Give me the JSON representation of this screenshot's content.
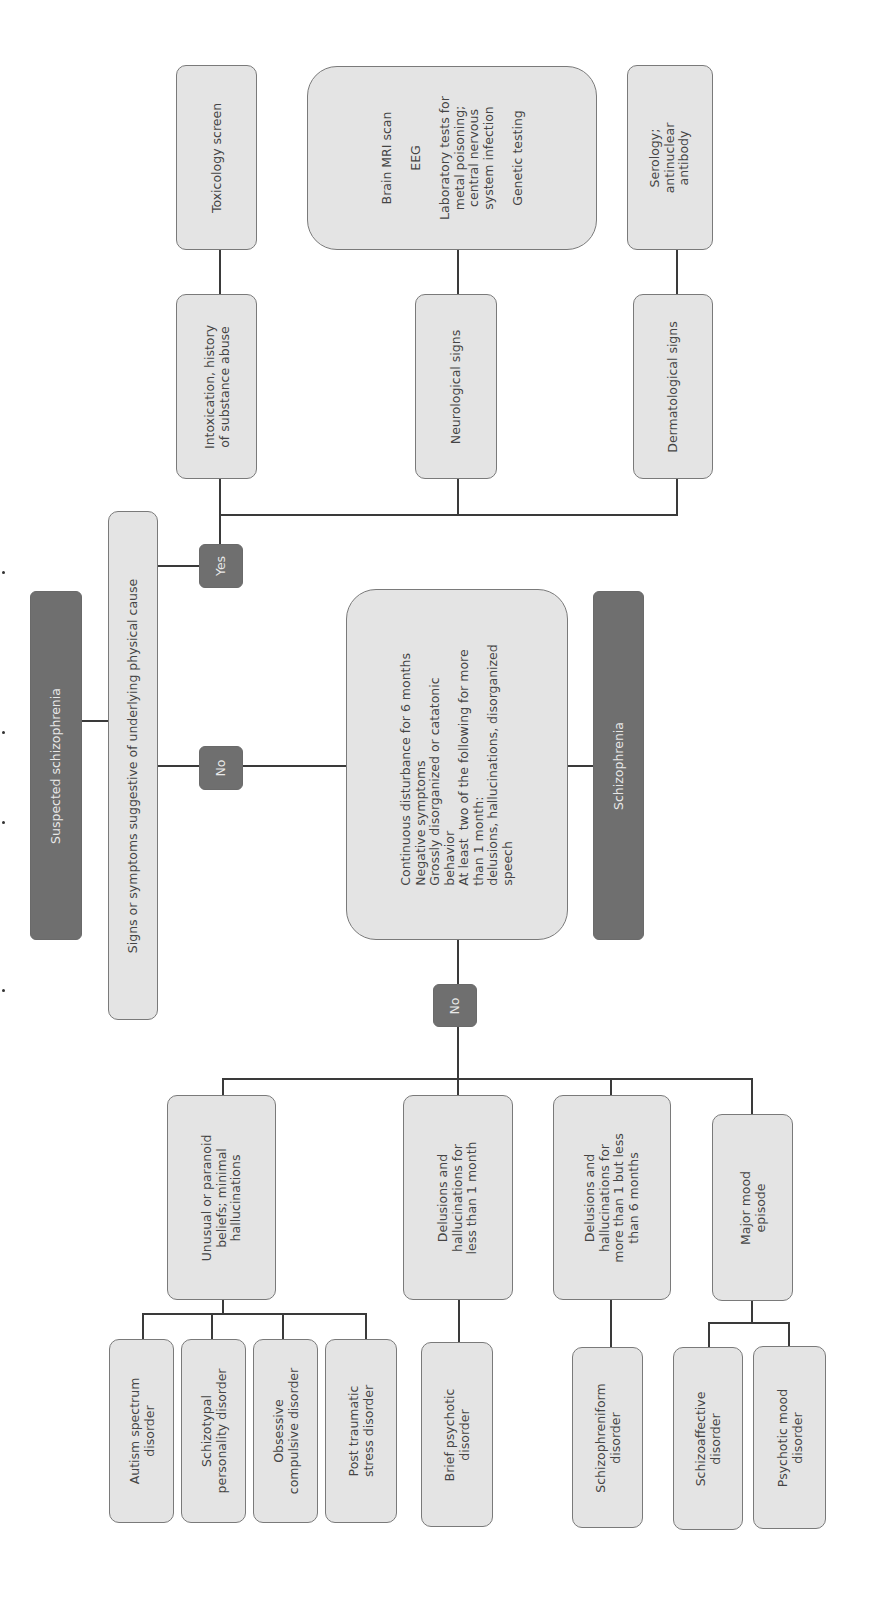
{
  "diagram": {
    "title": "Suspected schizophrenia",
    "root_question": "Signs or symptoms suggestive of underlying physical cause",
    "yes_label": "Yes",
    "no_label": "No",
    "no2_label": "No",
    "physical_causes": {
      "intoxication": "Intoxication, history\nof substance abuse",
      "toxicology": "Toxicology screen",
      "neurological": "Neurological signs",
      "neuro_tests": "Brain MRI scan\n\nEEG\n\nLaboratory tests for\nmetal poisoning;\ncentral nervous\nsystem infection\n\nGenetic testing",
      "dermatological": "Dermatological signs",
      "serology": "Serology;\nantinuclear\nantibody"
    },
    "criteria": "Continuous disturbance for 6 months\nNegative symptoms\nGrossly disorganized or catatonic\nbehavior\nAt least  two of the following for more\nthan 1 month:\ndelusions, hallucinations, disorganized\nspeech",
    "diagnosis": "Schizophrenia",
    "branches": [
      {
        "label": "Unusual or paranoid\nbeliefs; minimal\nhallucinations",
        "outcomes": [
          "Autism spectrum\ndisorder",
          "Schizotypal\npersonality disorder",
          "Obsessive\ncompulsive disorder",
          "Post traumatic\nstress disorder"
        ]
      },
      {
        "label": "Delusions and\nhallucinations for\nless than 1 month",
        "outcomes": [
          "Brief psychotic\ndisorder"
        ]
      },
      {
        "label": "Delusions and\nhallucinations for\nmore than 1 but less\nthan 6 months",
        "outcomes": [
          "Schizophreniform\ndisorder"
        ]
      },
      {
        "label": "Major mood\nepisode",
        "outcomes": [
          "Schizoaffective\ndisorder",
          "Psychotic mood\ndisorder"
        ]
      }
    ]
  },
  "colors": {
    "light_box": "#e4e4e4",
    "dark_box": "#6f6f6f",
    "border": "#7a7a7a",
    "line": "#3a3a3a"
  }
}
